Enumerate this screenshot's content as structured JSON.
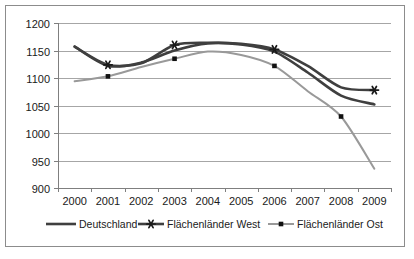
{
  "chart_data": {
    "type": "line",
    "title": "",
    "xlabel": "",
    "ylabel": "",
    "categories": [
      "2000",
      "2001",
      "2002",
      "2003",
      "2004",
      "2005",
      "2006",
      "2007",
      "2008",
      "2009"
    ],
    "ylim": [
      900,
      1200
    ],
    "yticks": [
      "900",
      "950",
      "1000",
      "1050",
      "1100",
      "1150",
      "1200"
    ],
    "grid": "horizontal",
    "legend_position": "bottom",
    "series": [
      {
        "name": "Deutschland",
        "color": "#3f3f3f",
        "marker": "none",
        "values": [
          1157,
          1122,
          1128,
          1150,
          1163,
          1161,
          1148,
          1110,
          1068,
          1052
        ]
      },
      {
        "name": "Flächenländer West",
        "color": "#3f3f3f",
        "marker": "star",
        "values": [
          1157,
          1124,
          1127,
          1160,
          1164,
          1162,
          1152,
          1122,
          1083,
          1078
        ]
      },
      {
        "name": "Flächenländer Ost",
        "color": "#999999",
        "marker": "dot",
        "values": [
          1094,
          1103,
          1120,
          1135,
          1148,
          1142,
          1122,
          1076,
          1030,
          935
        ]
      }
    ]
  },
  "legend": {
    "items": [
      {
        "label": "Deutschland"
      },
      {
        "label": "Flächenländer West"
      },
      {
        "label": "Flächenländer Ost"
      }
    ]
  }
}
